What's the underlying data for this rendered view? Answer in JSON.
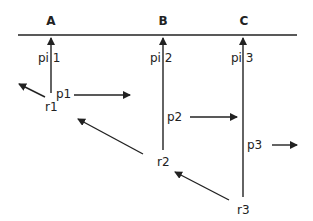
{
  "diagram": {
    "type": "timing-diagram",
    "colors": {
      "line": "#222222",
      "text": "#222222",
      "background": "#ffffff"
    },
    "columns": [
      {
        "id": "A",
        "label": "A"
      },
      {
        "id": "B",
        "label": "B"
      },
      {
        "id": "C",
        "label": "C"
      }
    ],
    "arrival_labels": [
      "pi 1",
      "pi 2",
      "pi 3"
    ],
    "propagation_labels": [
      "p1",
      "p2",
      "p3"
    ],
    "release_labels": [
      "r1",
      "r2",
      "r3"
    ]
  }
}
